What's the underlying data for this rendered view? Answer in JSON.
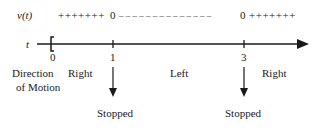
{
  "sign_chart": {
    "function_label": "v(t)",
    "variable_label": "t",
    "segments": [
      {
        "interval": "0 to 1",
        "sign": "+",
        "text": "+++++++"
      },
      {
        "at": 1,
        "value": "0"
      },
      {
        "interval": "1 to 3",
        "sign": "-",
        "text": "– – – – – – – – – – – – – –"
      },
      {
        "at": 3,
        "value": "0"
      },
      {
        "interval": "3 to ∞",
        "sign": "+",
        "text": "+++++++"
      }
    ],
    "ticks": [
      "0",
      "1",
      "3"
    ],
    "start_bracket": "[",
    "direction_label_line1": "Direction",
    "direction_label_line2": "of Motion",
    "directions": [
      "Right",
      "Left",
      "Right"
    ],
    "stopped_labels": [
      "Stopped",
      "Stopped"
    ],
    "line_color": "#1a1a1a"
  }
}
